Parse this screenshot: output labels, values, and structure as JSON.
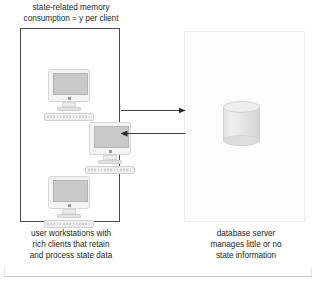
{
  "figure": {
    "background_color": "#ffffff"
  },
  "captions": {
    "top": "state-related memory\nconsumption = y per client",
    "left": "user workstations with\nrich clients that retain\nand process state data",
    "right": "database server\nmanages little or no\nstate information"
  },
  "client_box": {
    "label": "client boundary",
    "border_color": "#4e4e50",
    "workstations": [
      {
        "name": "workstation-1",
        "label": "user workstation"
      },
      {
        "name": "workstation-2",
        "label": "user workstation"
      },
      {
        "name": "workstation-3",
        "label": "user workstation"
      }
    ]
  },
  "server_box": {
    "label": "server boundary",
    "border_color": "#ededed",
    "database": {
      "name": "database-cylinder",
      "label": "database",
      "fill_color": "#e6e6e6"
    }
  },
  "arrows": [
    {
      "name": "arrow-client-to-server",
      "direction": "right",
      "label": "request to database server",
      "color": "#2b2b2b"
    },
    {
      "name": "arrow-server-to-client",
      "direction": "left",
      "label": "response from database server",
      "color": "#2b2b2b"
    }
  ],
  "bottom_rule": {
    "label": "figure base rule",
    "color": "#c8c8c8"
  }
}
